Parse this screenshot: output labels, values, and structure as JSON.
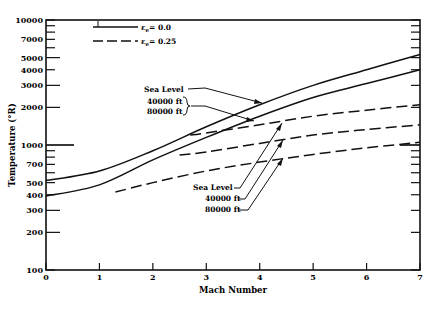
{
  "chart_data": {
    "type": "line",
    "title": "",
    "xlabel": "Mach Number",
    "ylabel": "Temperature (°R)",
    "xlim": [
      0,
      7
    ],
    "ylim": [
      100,
      10000
    ],
    "yscale": "log",
    "x_ticks": [
      "0",
      "1",
      "2",
      "3",
      "4",
      "5",
      "6",
      "7"
    ],
    "y_ticks": [
      "100",
      "200",
      "300",
      "400",
      "500",
      "700",
      "1000",
      "2000",
      "3000",
      "4000",
      "5000",
      "7000",
      "10000"
    ],
    "grid": false,
    "legend": {
      "position": "upper-left",
      "entries": [
        {
          "label": "ε_e = 0.0",
          "style": "solid"
        },
        {
          "label": "ε_e = 0.25",
          "style": "dashed"
        }
      ]
    },
    "series": [
      {
        "name": "ε_e = 0.0, Sea Level",
        "style": "solid",
        "x": [
          0,
          1,
          2,
          3,
          4,
          5,
          6,
          7
        ],
        "values": [
          520,
          620,
          900,
          1400,
          2100,
          3000,
          4000,
          5300
        ]
      },
      {
        "name": "ε_e = 0.0, 40000 ft / 80000 ft",
        "style": "solid",
        "x": [
          0,
          1,
          2,
          3,
          4,
          5,
          6,
          7
        ],
        "values": [
          390,
          480,
          760,
          1150,
          1700,
          2400,
          3100,
          4000
        ]
      },
      {
        "name": "ε_e = 0.25, Sea Level",
        "style": "dashed",
        "x": [
          2.7,
          3,
          4,
          5,
          6,
          7
        ],
        "values": [
          1200,
          1250,
          1450,
          1700,
          1900,
          2100
        ]
      },
      {
        "name": "ε_e = 0.25, 40000 ft",
        "style": "dashed",
        "x": [
          2.5,
          3,
          4,
          5,
          6,
          7
        ],
        "values": [
          830,
          880,
          1030,
          1200,
          1330,
          1450
        ]
      },
      {
        "name": "ε_e = 0.25, 80000 ft",
        "style": "dashed",
        "x": [
          1.3,
          2,
          3,
          4,
          5,
          6,
          7
        ],
        "values": [
          420,
          500,
          620,
          730,
          840,
          950,
          1050
        ]
      }
    ],
    "annotations": [
      {
        "text": "Sea Level",
        "target": "ε_e = 0.0, Sea Level"
      },
      {
        "text": "40000 ft",
        "target": "ε_e = 0.0 lower curve"
      },
      {
        "text": "80000 ft",
        "target": "ε_e = 0.0 lower curve"
      },
      {
        "text": "Sea Level",
        "target": "ε_e = 0.25, Sea Level"
      },
      {
        "text": "40000 ft",
        "target": "ε_e = 0.25, 40000 ft"
      },
      {
        "text": "80000 ft",
        "target": "ε_e = 0.25, 80000 ft"
      }
    ]
  },
  "labels": {
    "xlabel": "Mach Number",
    "ylabel": "Temperature (°R)",
    "legend_solid": "ε",
    "legend_solid_sub": "e",
    "legend_solid_val": "= 0.0",
    "legend_dashed": "ε",
    "legend_dashed_sub": "e",
    "legend_dashed_val": "= 0.25",
    "annot_sl_solid": "Sea Level",
    "annot_40k_solid": "40000 ft",
    "annot_80k_solid": "80000 ft",
    "annot_sl_dashed": "Sea Level",
    "annot_40k_dashed": "40000 ft",
    "annot_80k_dashed": "80000 ft"
  }
}
